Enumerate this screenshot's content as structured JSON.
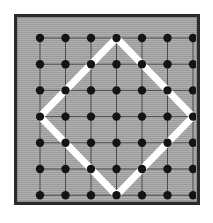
{
  "figure": {
    "canvas": {
      "width": 213,
      "height": 223,
      "background": "#ffffff"
    },
    "frame": {
      "x": 14,
      "y": 14,
      "width": 186,
      "height": 191,
      "border_color": "#2b2b2b",
      "border_width": 3,
      "fill_color": "#a3a3a3"
    },
    "lattice": {
      "rows": 7,
      "columns": 7,
      "dot_count": 49,
      "dot_color": "#141414",
      "dot_radius": 4.2,
      "gridline_color": "#4a4a4a",
      "gridline_width": 1,
      "origin_x": 26,
      "origin_y": 24,
      "spacing_x": 25.5,
      "spacing_y": 26.2,
      "column_x": [
        26,
        51.5,
        77,
        102.5,
        128,
        153.5,
        179
      ],
      "row_y": [
        24,
        50.2,
        76.4,
        102.6,
        128.8,
        155,
        181.2
      ]
    },
    "polygon": {
      "name": "tilted-square",
      "shape": "diamond",
      "stroke_color": "#ffffff",
      "stroke_width": 7,
      "vertices": [
        {
          "label": "top",
          "row": 1,
          "col": 4,
          "x": 102.5,
          "y": 24
        },
        {
          "label": "right",
          "row": 4,
          "col": 7,
          "x": 179,
          "y": 102.6
        },
        {
          "label": "bottom",
          "row": 7,
          "col": 4,
          "x": 102.5,
          "y": 181.2
        },
        {
          "label": "left",
          "row": 4,
          "col": 1,
          "x": 26,
          "y": 102.6
        }
      ]
    }
  },
  "chart_data": {
    "type": "scatter",
    "xlabel": "",
    "ylabel": "",
    "xlim": [
      1,
      7
    ],
    "ylim": [
      1,
      7
    ],
    "grid": true,
    "legend": "none",
    "x": [
      1,
      2,
      3,
      4,
      5,
      6,
      7,
      1,
      2,
      3,
      4,
      5,
      6,
      7,
      1,
      2,
      3,
      4,
      5,
      6,
      7,
      1,
      2,
      3,
      4,
      5,
      6,
      7,
      1,
      2,
      3,
      4,
      5,
      6,
      7,
      1,
      2,
      3,
      4,
      5,
      6,
      7,
      1,
      2,
      3,
      4,
      5,
      6,
      7
    ],
    "y": [
      1,
      1,
      1,
      1,
      1,
      1,
      1,
      2,
      2,
      2,
      2,
      2,
      2,
      2,
      3,
      3,
      3,
      3,
      3,
      3,
      3,
      4,
      4,
      4,
      4,
      4,
      4,
      4,
      5,
      5,
      5,
      5,
      5,
      5,
      5,
      6,
      6,
      6,
      6,
      6,
      6,
      6,
      7,
      7,
      7,
      7,
      7,
      7,
      7
    ],
    "annotations": [
      {
        "type": "polygon",
        "label": "tilted square",
        "points": [
          [
            4,
            1
          ],
          [
            7,
            4
          ],
          [
            4,
            7
          ],
          [
            1,
            4
          ]
        ],
        "color": "#ffffff"
      }
    ]
  }
}
